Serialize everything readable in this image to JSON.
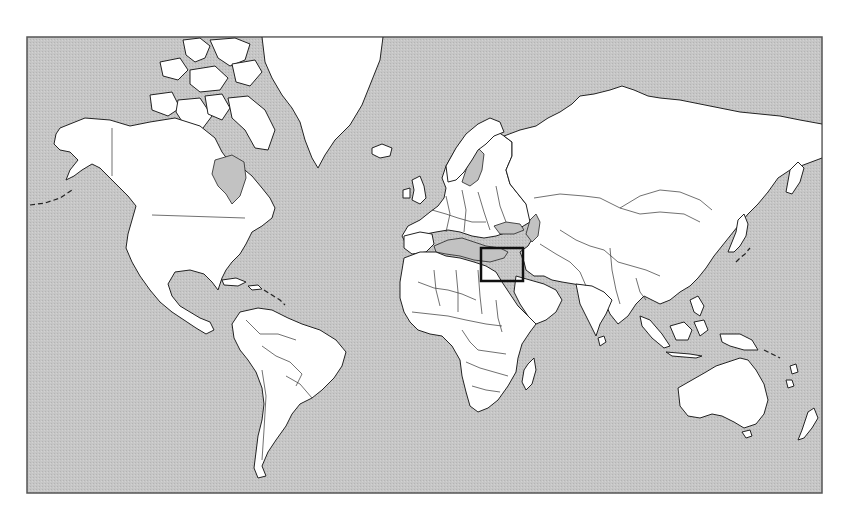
{
  "map": {
    "type": "world-political-outline",
    "projection": "mercator",
    "width": 845,
    "height": 519,
    "frame": {
      "x": 27,
      "y": 37,
      "width": 795,
      "height": 456
    },
    "colors": {
      "page_background": "#ffffff",
      "ocean": "#c4c4c4",
      "land": "#ffffff",
      "outline": "#222222",
      "frame_border": "#555555",
      "highlight_box": "#111111"
    },
    "highlight_box": {
      "label": "",
      "region": "Eastern Mediterranean / Levant",
      "x": 481,
      "y": 248,
      "width": 42,
      "height": 33,
      "stroke_width": 2.5
    },
    "continents": [
      "North America",
      "Greenland",
      "South America",
      "Europe",
      "Africa",
      "Asia",
      "Australia",
      "New Zealand",
      "Madagascar"
    ],
    "text_labels": []
  }
}
